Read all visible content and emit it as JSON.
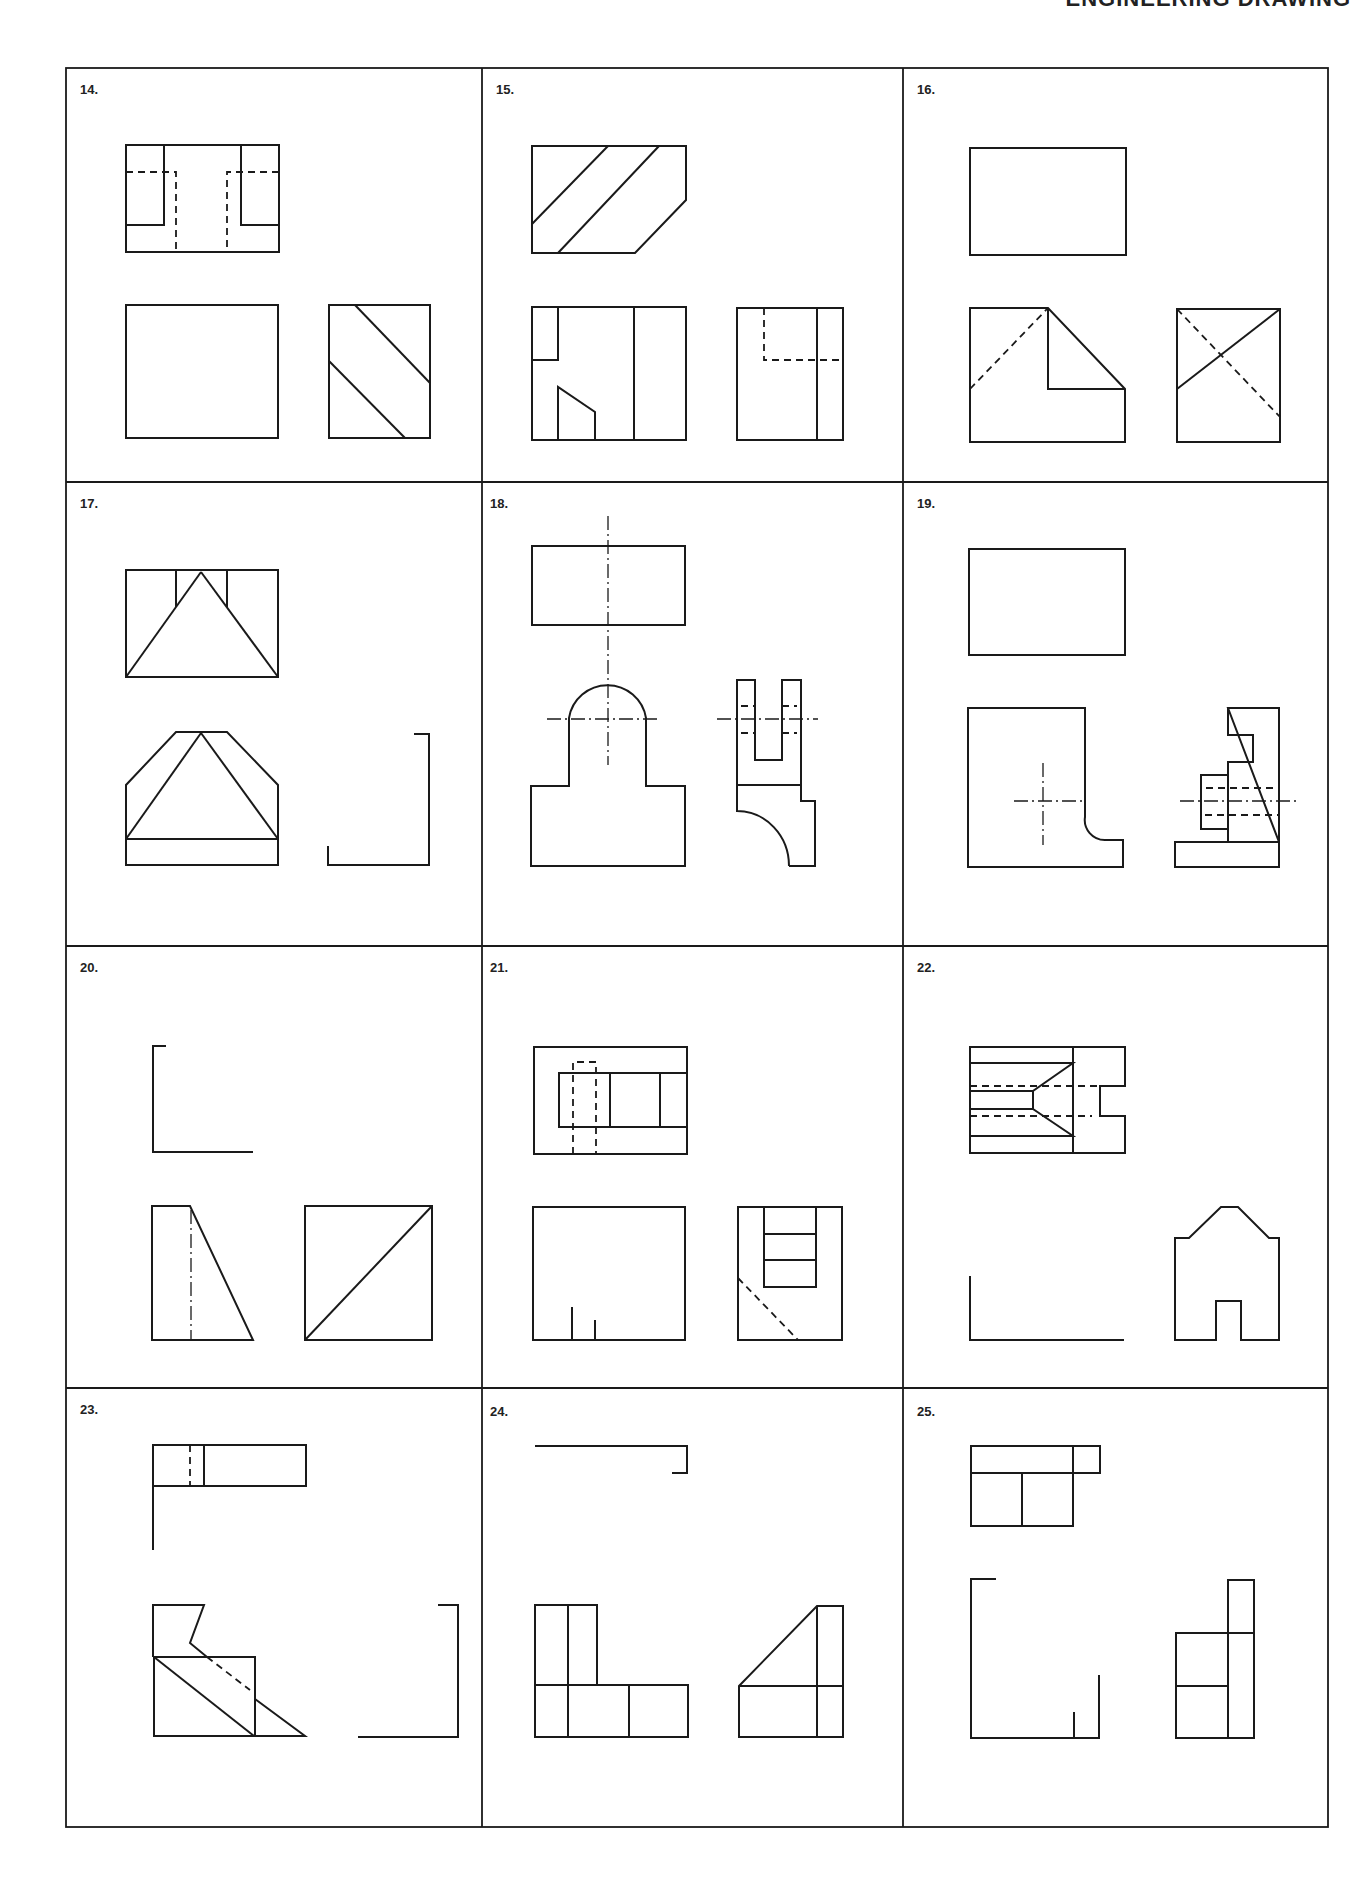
{
  "page": {
    "header_text": "ENGINEERING DRAWING"
  },
  "panels": [
    {
      "number": "14.",
      "label": "14."
    },
    {
      "number": "15.",
      "label": "15."
    },
    {
      "number": "16.",
      "label": "16."
    },
    {
      "number": "17.",
      "label": "17."
    },
    {
      "number": "18.",
      "label": "18."
    },
    {
      "number": "19.",
      "label": "19."
    },
    {
      "number": "20.",
      "label": "20."
    },
    {
      "number": "21.",
      "label": "21."
    },
    {
      "number": "22.",
      "label": "22."
    },
    {
      "number": "23.",
      "label": "23."
    },
    {
      "number": "24.",
      "label": "24."
    },
    {
      "number": "25.",
      "label": "25."
    }
  ],
  "line_styles": {
    "visible": "solid",
    "hidden": "dashed",
    "center": "chain"
  },
  "colors": {
    "ink": "#1a1a1a",
    "paper": "#ffffff"
  }
}
